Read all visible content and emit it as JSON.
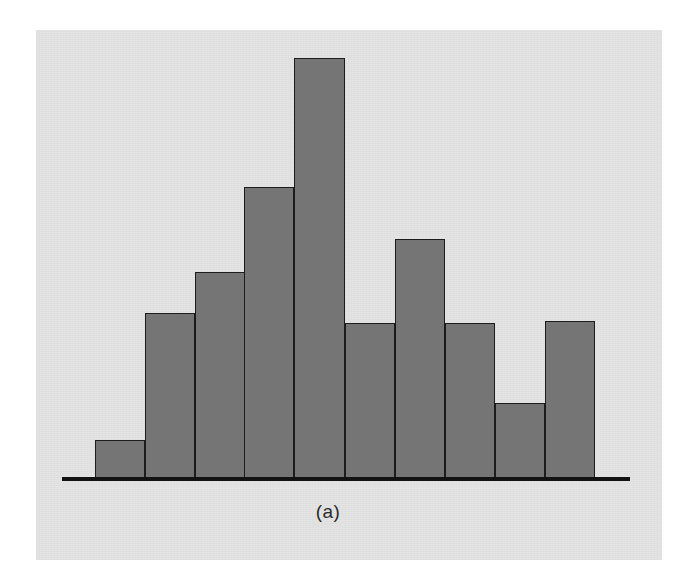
{
  "figure": {
    "caption": "(a)",
    "background_color": "#e3e3e4",
    "page_color": "#ffffff",
    "bar_fill_color": "#757575",
    "bar_edge_color": "#1c1c1c",
    "axis_color": "#121212"
  },
  "chart_data": {
    "type": "bar",
    "title": "",
    "subtitle": "",
    "xlabel": "",
    "ylabel": "",
    "annotations": [
      "(a)"
    ],
    "legend": [],
    "legend_position": "none",
    "grid": false,
    "axis_visible": {
      "x": true,
      "y": false
    },
    "bar_gap": 0,
    "categories": [
      "1",
      "2",
      "3",
      "4",
      "5",
      "6",
      "7",
      "8",
      "9",
      "10"
    ],
    "values": [
      9,
      39,
      49,
      69,
      100,
      37,
      57,
      37,
      18,
      37
    ],
    "ylim": [
      0,
      100
    ],
    "bars_px": [
      {
        "index": 1,
        "left": 95,
        "top": 440,
        "width": 50,
        "height": 38
      },
      {
        "index": 2,
        "left": 145,
        "top": 313,
        "width": 50,
        "height": 165
      },
      {
        "index": 3,
        "left": 195,
        "top": 272,
        "width": 50,
        "height": 206
      },
      {
        "index": 4,
        "left": 244,
        "top": 187,
        "width": 50,
        "height": 291
      },
      {
        "index": 5,
        "left": 294,
        "top": 58,
        "width": 51,
        "height": 420
      },
      {
        "index": 6,
        "left": 345,
        "top": 323,
        "width": 50,
        "height": 155
      },
      {
        "index": 7,
        "left": 395,
        "top": 239,
        "width": 50,
        "height": 239
      },
      {
        "index": 8,
        "left": 445,
        "top": 323,
        "width": 50,
        "height": 155
      },
      {
        "index": 9,
        "left": 495,
        "top": 403,
        "width": 50,
        "height": 75
      },
      {
        "index": 10,
        "left": 545,
        "top": 321,
        "width": 50,
        "height": 157
      }
    ]
  }
}
